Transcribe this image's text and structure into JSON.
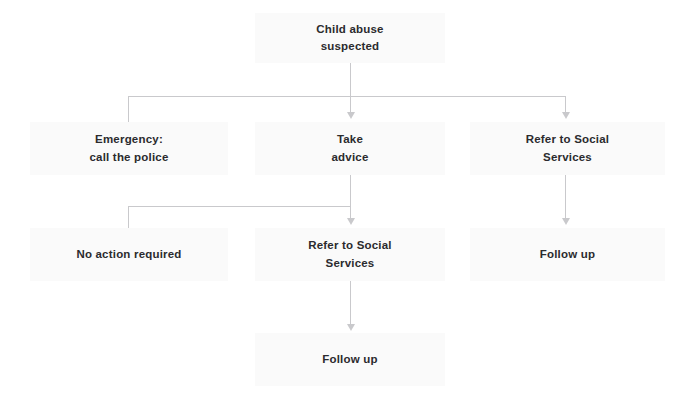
{
  "diagram": {
    "colors": {
      "node_fill": "#fafafa",
      "text": "#2b2b2e",
      "connector": "#c9c9cc",
      "background": "#ffffff"
    },
    "nodes": [
      {
        "id": "root",
        "label": "Child abuse\nsuspected",
        "x": 255,
        "y": 13,
        "w": 190,
        "h": 50
      },
      {
        "id": "emergency",
        "label": "Emergency:\ncall the police",
        "x": 30,
        "y": 122,
        "w": 198,
        "h": 53
      },
      {
        "id": "take-advice",
        "label": "Take\nadvice",
        "x": 255,
        "y": 122,
        "w": 190,
        "h": 53
      },
      {
        "id": "refer-right",
        "label": "Refer to Social\nServices",
        "x": 470,
        "y": 122,
        "w": 195,
        "h": 53
      },
      {
        "id": "no-action",
        "label": "No action required",
        "x": 30,
        "y": 228,
        "w": 198,
        "h": 53
      },
      {
        "id": "refer-middle",
        "label": "Refer to Social\nServices",
        "x": 255,
        "y": 228,
        "w": 190,
        "h": 53
      },
      {
        "id": "follow-up-right",
        "label": "Follow up",
        "x": 470,
        "y": 228,
        "w": 195,
        "h": 53
      },
      {
        "id": "follow-up-mid",
        "label": "Follow up",
        "x": 255,
        "y": 333,
        "w": 190,
        "h": 53
      }
    ],
    "edges": [
      {
        "id": "root-to-bus",
        "from": "root",
        "to": "branch-bus-1"
      },
      {
        "id": "bus-to-emergency",
        "from": "branch-bus-1",
        "to": "emergency",
        "arrow": false
      },
      {
        "id": "bus-to-take-advice",
        "from": "branch-bus-1",
        "to": "take-advice",
        "arrow": true
      },
      {
        "id": "bus-to-refer-right",
        "from": "branch-bus-1",
        "to": "refer-right",
        "arrow": true
      },
      {
        "id": "advice-to-bus",
        "from": "take-advice",
        "to": "branch-bus-2"
      },
      {
        "id": "bus2-to-no-action",
        "from": "branch-bus-2",
        "to": "no-action",
        "arrow": false
      },
      {
        "id": "bus2-to-refer-middle",
        "from": "branch-bus-2",
        "to": "refer-middle",
        "arrow": true
      },
      {
        "id": "refer-right-to-followup",
        "from": "refer-right",
        "to": "follow-up-right",
        "arrow": true
      },
      {
        "id": "refer-mid-to-followup",
        "from": "refer-middle",
        "to": "follow-up-mid",
        "arrow": true
      }
    ]
  }
}
